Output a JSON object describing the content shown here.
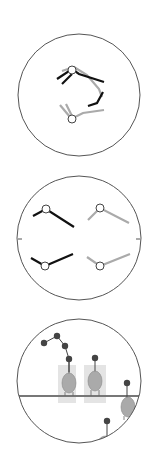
{
  "colors": {
    "outline": "#555555",
    "black_stroke": "#111111",
    "gray_stroke": "#aaaaaa",
    "node_fill": "#ffffff",
    "dot_fill": "#444444",
    "body_fill": "#aaaaaa",
    "box_fill": "#e6e6e6",
    "line": "#777777"
  },
  "panels": [
    {
      "name": "panel-1",
      "cx": 79,
      "cy": 95,
      "r": 61
    },
    {
      "name": "panel-2",
      "cx": 79,
      "cy": 238,
      "r": 62
    },
    {
      "name": "panel-3",
      "cx": 79,
      "cy": 381,
      "r": 62
    }
  ]
}
